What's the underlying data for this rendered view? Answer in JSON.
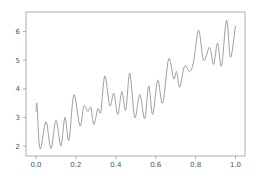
{
  "chart_data": {
    "type": "line",
    "title": "",
    "xlabel": "",
    "ylabel": "",
    "xlim": [
      -0.05,
      1.05
    ],
    "ylim": [
      1.7,
      6.7
    ],
    "grid": false,
    "legend": null,
    "x_ticks": [
      0.0,
      0.2,
      0.4,
      0.6,
      0.8,
      1.0
    ],
    "x_tick_labels": [
      "0.0",
      "0.2",
      "0.4",
      "0.6",
      "0.8",
      "1.0"
    ],
    "y_ticks": [
      2,
      3,
      4,
      5,
      6
    ],
    "y_tick_labels": [
      "2",
      "3",
      "4",
      "5",
      "6"
    ],
    "line_color": "#a0a0a0",
    "series": [
      {
        "name": "signal",
        "x": [
          0.0,
          0.005,
          0.02,
          0.05,
          0.075,
          0.1,
          0.125,
          0.145,
          0.165,
          0.19,
          0.22,
          0.24,
          0.26,
          0.275,
          0.29,
          0.31,
          0.325,
          0.345,
          0.37,
          0.39,
          0.41,
          0.43,
          0.45,
          0.47,
          0.495,
          0.52,
          0.545,
          0.565,
          0.585,
          0.61,
          0.635,
          0.665,
          0.69,
          0.705,
          0.72,
          0.745,
          0.77,
          0.79,
          0.815,
          0.84,
          0.87,
          0.89,
          0.91,
          0.93,
          0.955,
          0.975,
          1.0
        ],
        "y": [
          3.2,
          3.45,
          1.9,
          2.85,
          1.9,
          2.9,
          2.0,
          3.0,
          2.2,
          3.8,
          2.7,
          3.4,
          3.2,
          3.35,
          2.75,
          3.3,
          3.2,
          4.45,
          3.4,
          3.85,
          3.1,
          3.9,
          3.25,
          4.55,
          3.0,
          3.8,
          2.95,
          4.1,
          3.1,
          4.3,
          3.5,
          5.05,
          4.35,
          4.6,
          4.05,
          4.8,
          4.6,
          4.95,
          6.05,
          5.0,
          5.45,
          4.85,
          5.6,
          4.8,
          6.4,
          5.1,
          6.2
        ]
      }
    ]
  },
  "layout": {
    "plot_left": 26,
    "plot_top": 12,
    "plot_right": 245,
    "plot_bottom": 156,
    "x0_px": 36,
    "x_px_per_unit": 199.5,
    "y2_px": 146,
    "y_px_per_unit": 28.6
  }
}
